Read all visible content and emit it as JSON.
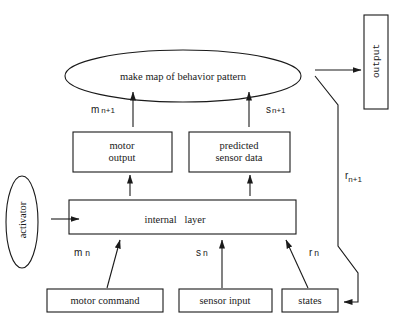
{
  "diagram": {
    "nodes": {
      "map": {
        "label": "make map of behavior pattern",
        "shape": "ellipse"
      },
      "output": {
        "label": "output",
        "shape": "rect",
        "orientation": "vertical"
      },
      "motor_output": {
        "line1": "motor",
        "line2": "output",
        "shape": "rect"
      },
      "predicted_sensor": {
        "line1": "predicted",
        "line2": "sensor data",
        "shape": "rect"
      },
      "internal_layer": {
        "label": "internal   layer",
        "shape": "rect"
      },
      "activator": {
        "label": "activator",
        "shape": "ellipse",
        "orientation": "vertical"
      },
      "motor_command": {
        "label": "motor command",
        "shape": "rect"
      },
      "sensor_input": {
        "label": "sensor input",
        "shape": "rect"
      },
      "states": {
        "label": "states",
        "shape": "rect"
      }
    },
    "edge_labels": {
      "m_next": {
        "base": "m",
        "sub": "n+1"
      },
      "s_next": {
        "base": "s",
        "sub": "n+1"
      },
      "r_next": {
        "base": "r",
        "sub": "n+1"
      },
      "m_n": {
        "base": "m",
        "sub": "n"
      },
      "s_n": {
        "base": "s",
        "sub": "n"
      },
      "r_n": {
        "base": "r",
        "sub": "n"
      }
    },
    "edges": [
      {
        "from": "motor_output",
        "to": "map",
        "label": "m n+1"
      },
      {
        "from": "predicted_sensor",
        "to": "map",
        "label": "s n+1"
      },
      {
        "from": "map",
        "to": "output"
      },
      {
        "from": "map",
        "to": "states",
        "label": "r n+1"
      },
      {
        "from": "internal_layer",
        "to": "motor_output"
      },
      {
        "from": "internal_layer",
        "to": "predicted_sensor"
      },
      {
        "from": "activator",
        "to": "internal_layer"
      },
      {
        "from": "motor_command",
        "to": "internal_layer",
        "label": "m n"
      },
      {
        "from": "sensor_input",
        "to": "internal_layer",
        "label": "s n"
      },
      {
        "from": "states",
        "to": "internal_layer",
        "label": "r n"
      }
    ],
    "colors": {
      "stroke": "#1a1a1a",
      "background": "#ffffff"
    }
  }
}
